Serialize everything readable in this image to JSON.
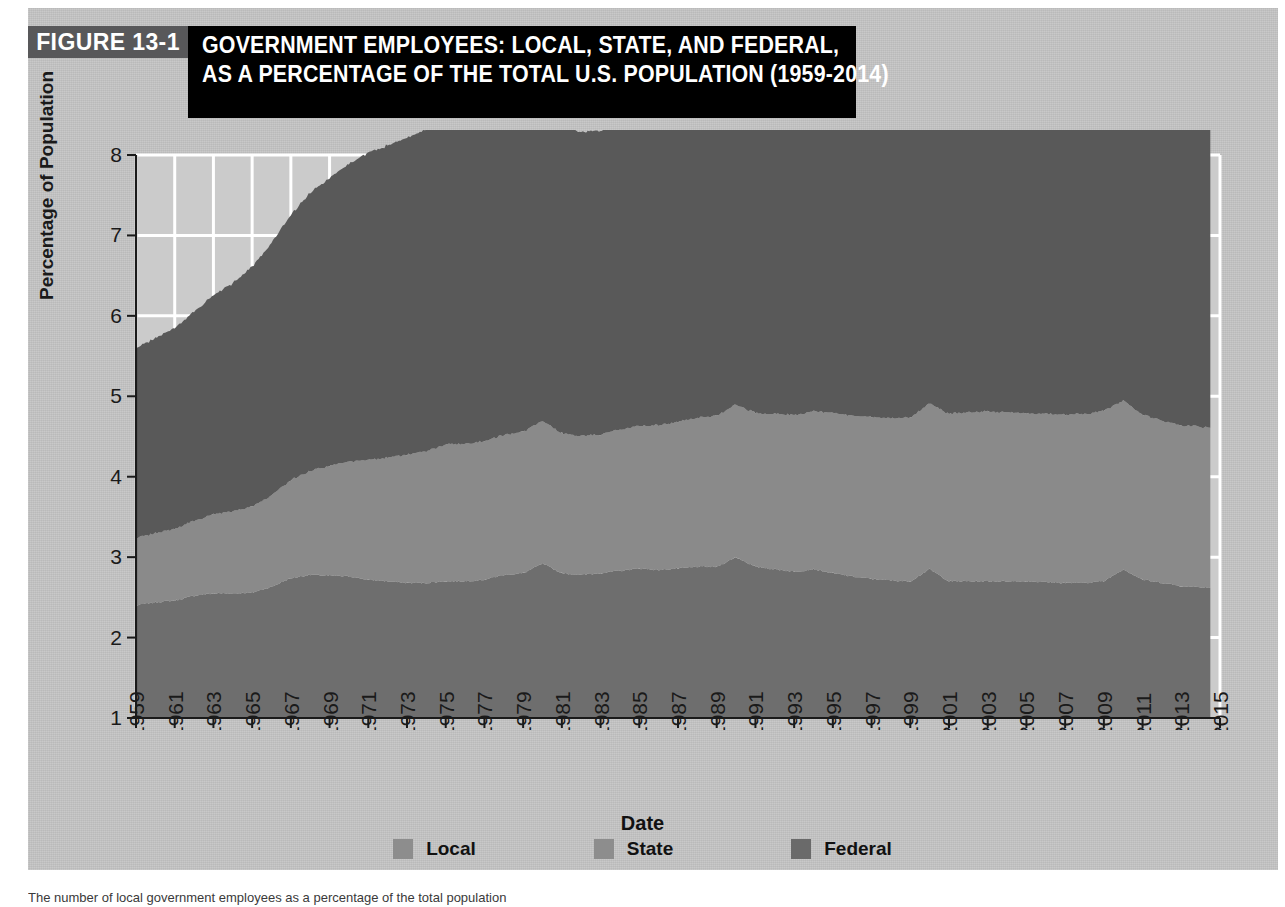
{
  "figure": {
    "number_label": "FIGURE 13-1",
    "title_lines": [
      "GOVERNMENT EMPLOYEES: LOCAL, STATE, AND FEDERAL,",
      "AS A PERCENTAGE OF THE TOTAL U.S. POPULATION (1959-2014)"
    ],
    "caption": "The number of local government employees as a percentage of the total population",
    "panel_color": "#c4c4c4",
    "number_box_color": "#58585a",
    "title_box_color": "#000000"
  },
  "chart_data": {
    "type": "area",
    "stacked": true,
    "title": "GOVERNMENT EMPLOYEES: LOCAL, STATE, AND FEDERAL, AS A PERCENTAGE OF THE TOTAL U.S. POPULATION (1959-2014)",
    "xlabel": "Date",
    "ylabel": "Percentage of Population",
    "xlim": [
      1959,
      2015
    ],
    "ylim": [
      1,
      8
    ],
    "yticks": [
      1,
      2,
      3,
      4,
      5,
      6,
      7,
      8
    ],
    "xticks": [
      1959,
      1961,
      1963,
      1965,
      1967,
      1969,
      1971,
      1973,
      1975,
      1977,
      1979,
      1981,
      1983,
      1985,
      1987,
      1989,
      1991,
      1993,
      1995,
      1997,
      1999,
      2001,
      2003,
      2005,
      2007,
      2009,
      2011,
      2013,
      2015
    ],
    "grid": true,
    "grid_color": "#ffffff",
    "legend_position": "bottom",
    "data_end_x": 2014.5,
    "stack_order_bottom_to_top": [
      "Federal",
      "State",
      "Local"
    ],
    "x": [
      1959,
      1960,
      1961,
      1962,
      1963,
      1964,
      1965,
      1966,
      1967,
      1968,
      1969,
      1970,
      1971,
      1972,
      1973,
      1974,
      1975,
      1976,
      1977,
      1978,
      1979,
      1980,
      1981,
      1982,
      1983,
      1984,
      1985,
      1986,
      1987,
      1988,
      1989,
      1990,
      1991,
      1992,
      1993,
      1994,
      1995,
      1996,
      1997,
      1998,
      1999,
      2000,
      2001,
      2002,
      2003,
      2004,
      2005,
      2006,
      2007,
      2008,
      2009,
      2010,
      2011,
      2012,
      2013,
      2014.5
    ],
    "series": [
      {
        "name": "Federal",
        "color": "#6e6e6e",
        "legend_swatch": "#6e6e6e",
        "values": [
          1.4,
          1.44,
          1.46,
          1.52,
          1.55,
          1.55,
          1.56,
          1.63,
          1.74,
          1.78,
          1.77,
          1.76,
          1.72,
          1.7,
          1.68,
          1.68,
          1.7,
          1.7,
          1.72,
          1.78,
          1.8,
          1.92,
          1.8,
          1.78,
          1.8,
          1.83,
          1.86,
          1.84,
          1.86,
          1.88,
          1.88,
          2.0,
          1.88,
          1.85,
          1.82,
          1.85,
          1.8,
          1.76,
          1.73,
          1.71,
          1.7,
          1.85,
          1.7,
          1.7,
          1.7,
          1.7,
          1.7,
          1.69,
          1.68,
          1.68,
          1.7,
          1.85,
          1.72,
          1.68,
          1.64,
          1.62
        ]
      },
      {
        "name": "State",
        "color": "#8a8a8a",
        "legend_swatch": "#8a8a8a",
        "values": [
          0.84,
          0.86,
          0.89,
          0.93,
          0.98,
          1.02,
          1.07,
          1.14,
          1.22,
          1.29,
          1.36,
          1.43,
          1.49,
          1.54,
          1.59,
          1.64,
          1.7,
          1.71,
          1.72,
          1.74,
          1.76,
          1.77,
          1.74,
          1.73,
          1.73,
          1.75,
          1.77,
          1.8,
          1.82,
          1.85,
          1.88,
          1.9,
          1.91,
          1.93,
          1.95,
          1.97,
          1.99,
          2.0,
          2.01,
          2.02,
          2.04,
          2.06,
          2.08,
          2.1,
          2.11,
          2.1,
          2.09,
          2.09,
          2.09,
          2.1,
          2.12,
          2.1,
          2.05,
          2.02,
          2.0,
          1.99
        ]
      },
      {
        "name": "Local",
        "color": "#595959",
        "legend_swatch": "#595959",
        "values": [
          2.36,
          2.42,
          2.5,
          2.6,
          2.72,
          2.84,
          2.98,
          3.14,
          3.3,
          3.46,
          3.58,
          3.7,
          3.82,
          3.88,
          3.94,
          4.0,
          4.06,
          4.05,
          4.04,
          4.05,
          4.1,
          4.02,
          3.85,
          3.78,
          3.78,
          3.84,
          3.92,
          4.0,
          4.08,
          4.16,
          4.24,
          4.38,
          4.32,
          4.34,
          4.38,
          4.4,
          4.42,
          4.44,
          4.46,
          4.48,
          4.52,
          4.6,
          4.62,
          4.66,
          4.72,
          4.7,
          4.7,
          4.72,
          4.74,
          4.76,
          4.76,
          4.8,
          4.68,
          4.6,
          4.56,
          4.52
        ]
      }
    ]
  },
  "legend": [
    {
      "label": "Local",
      "color": "#8d8d8d"
    },
    {
      "label": "State",
      "color": "#8d8d8d"
    },
    {
      "label": "Federal",
      "color": "#6a6a6a"
    }
  ]
}
